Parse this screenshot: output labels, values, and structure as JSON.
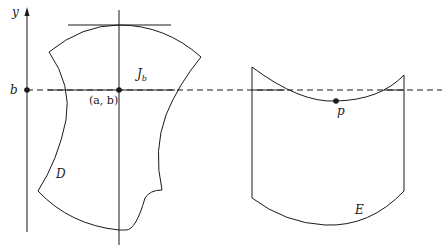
{
  "diagram": {
    "axis": {
      "y_label": "y",
      "b_label": "b"
    },
    "region_d": {
      "label": "D",
      "point_label": "(a, b)",
      "line_label": "J",
      "line_label_sub": "b"
    },
    "region_e": {
      "label": "E",
      "point_label": "p"
    },
    "colors": {
      "stroke": "#1a1a1a",
      "background": "#ffffff"
    }
  }
}
